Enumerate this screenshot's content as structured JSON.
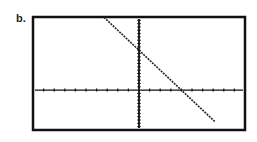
{
  "label": "b.",
  "chart_data": {
    "type": "line",
    "title": "",
    "xlabel": "",
    "ylabel": "",
    "xlim": [
      -10,
      10
    ],
    "ylim": [
      -12,
      22
    ],
    "xscale": 1,
    "yscale": 1,
    "grid": false,
    "series": [
      {
        "name": "y = -3x + 12",
        "slope": -3,
        "intercept": 12,
        "x": [
          -3.3,
          7.2
        ],
        "y": [
          21.9,
          -9.6
        ]
      }
    ],
    "y_intercept": 12,
    "x_intercept": 4
  },
  "frame": {
    "x0": 33,
    "y0": 17,
    "x1": 245,
    "y1": 130
  },
  "colors": {
    "axis": "#111111",
    "line": "#222222",
    "frame": "#111111"
  }
}
